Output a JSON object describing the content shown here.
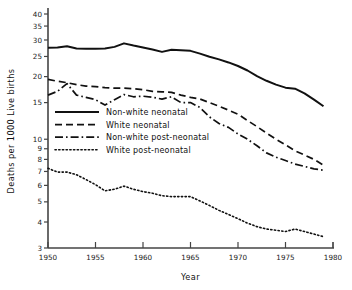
{
  "chart_data": {
    "type": "line",
    "title": "",
    "xlabel": "Year",
    "ylabel": "Deaths per 1000 Live births",
    "yscale": "log",
    "ylim": [
      3,
      40
    ],
    "xlim": [
      1950,
      1980
    ],
    "grid": false,
    "legend_position": "center-left",
    "xticks": [
      1950,
      1955,
      1960,
      1965,
      1970,
      1975,
      1980
    ],
    "xtick_labels": [
      "1950",
      "1955",
      "1960",
      "1965",
      "1970",
      "1975",
      "1980"
    ],
    "yticks": [
      3,
      4,
      5,
      6,
      7,
      8,
      9,
      10,
      15,
      20,
      25,
      30,
      35,
      40
    ],
    "ytick_labels": [
      "3",
      "4",
      "5",
      "6",
      "7",
      "8",
      "9",
      "10",
      "15",
      "20",
      "25",
      "30",
      "35",
      "40"
    ],
    "x": [
      1950,
      1951,
      1952,
      1953,
      1954,
      1955,
      1956,
      1957,
      1958,
      1959,
      1960,
      1961,
      1962,
      1963,
      1964,
      1965,
      1966,
      1967,
      1968,
      1969,
      1970,
      1971,
      1972,
      1973,
      1974,
      1975,
      1976,
      1977,
      1978,
      1979
    ],
    "series": [
      {
        "name": "Non-white neonatal",
        "style": "solid",
        "color": "#111111",
        "values": [
          27.5,
          27.6,
          28.0,
          27.3,
          27.2,
          27.2,
          27.3,
          27.8,
          28.9,
          28.2,
          27.6,
          27.0,
          26.3,
          26.9,
          26.8,
          26.6,
          25.8,
          24.9,
          24.2,
          23.4,
          22.5,
          21.4,
          20.1,
          19.1,
          18.3,
          17.7,
          17.5,
          16.6,
          15.5,
          14.4
        ]
      },
      {
        "name": "White neonatal",
        "style": "dashed",
        "color": "#111111",
        "values": [
          19.4,
          19.0,
          18.7,
          18.3,
          18.0,
          17.9,
          17.7,
          17.6,
          17.6,
          17.5,
          17.3,
          17.0,
          16.9,
          16.8,
          16.3,
          15.9,
          15.6,
          15.0,
          14.4,
          13.8,
          13.2,
          12.3,
          11.5,
          10.7,
          10.0,
          9.4,
          8.8,
          8.4,
          8.0,
          7.5
        ]
      },
      {
        "name": "Non-white post-neonatal",
        "style": "dashdot",
        "color": "#111111",
        "values": [
          16.3,
          17.0,
          18.5,
          16.3,
          15.9,
          15.5,
          14.6,
          15.5,
          16.4,
          16.0,
          16.1,
          15.9,
          15.6,
          16.0,
          15.0,
          15.0,
          14.2,
          12.8,
          11.9,
          11.4,
          10.6,
          10.0,
          9.3,
          8.6,
          8.2,
          7.9,
          7.6,
          7.4,
          7.2,
          7.1
        ]
      },
      {
        "name": "White post-neonatal",
        "style": "dotted",
        "color": "#111111",
        "values": [
          7.25,
          6.95,
          6.95,
          6.75,
          6.4,
          6.05,
          5.65,
          5.75,
          5.95,
          5.75,
          5.6,
          5.5,
          5.35,
          5.3,
          5.3,
          5.3,
          5.05,
          4.8,
          4.55,
          4.35,
          4.15,
          3.95,
          3.8,
          3.7,
          3.65,
          3.6,
          3.7,
          3.6,
          3.5,
          3.4
        ]
      }
    ],
    "legend": [
      {
        "label": "Non-white neonatal",
        "style": "solid"
      },
      {
        "label": "White neonatal",
        "style": "dashed"
      },
      {
        "label": "Non-white post-neonatal",
        "style": "dashdot"
      },
      {
        "label": "White post-neonatal",
        "style": "dotted"
      }
    ]
  }
}
